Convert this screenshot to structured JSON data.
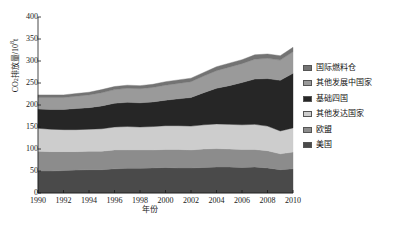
{
  "chart_data": {
    "type": "area",
    "title": "",
    "subtitle": "",
    "xlabel": "年份",
    "ylabel": "CO2排放量/10^8 t",
    "ylabel_prefix": "CO",
    "ylabel_sub": "2",
    "ylabel_mid": "排放量/10",
    "ylabel_sup": "8",
    "ylabel_suffix": "t",
    "stacked": true,
    "grid": false,
    "legend_position": "right",
    "xlim": [
      1990,
      2010
    ],
    "ylim": [
      0,
      400
    ],
    "ytick_labels": [
      "0",
      "50",
      "100",
      "150",
      "200",
      "250",
      "300",
      "350",
      "400"
    ],
    "yticks": [
      0,
      50,
      100,
      150,
      200,
      250,
      300,
      350,
      400
    ],
    "xtick_labels": [
      "1990",
      "1992",
      "1994",
      "1996",
      "1998",
      "2000",
      "2002",
      "2004",
      "2006",
      "2008",
      "2010"
    ],
    "xticks": [
      1990,
      1992,
      1994,
      1996,
      1998,
      2000,
      2002,
      2004,
      2006,
      2008,
      2010
    ],
    "x": [
      1990,
      1991,
      1992,
      1993,
      1994,
      1995,
      1996,
      1997,
      1998,
      1999,
      2000,
      2001,
      2002,
      2003,
      2004,
      2005,
      2006,
      2007,
      2008,
      2009,
      2010
    ],
    "series": [
      {
        "name": "美国",
        "color": "#4a4a4a",
        "values": [
          50,
          50,
          51,
          52,
          53,
          53,
          55,
          56,
          56,
          57,
          58,
          57,
          57,
          58,
          59,
          59,
          58,
          59,
          57,
          53,
          55
        ]
      },
      {
        "name": "欧盟",
        "color": "#8c8c8c",
        "values": [
          45,
          44,
          43,
          42,
          42,
          42,
          43,
          42,
          42,
          41,
          41,
          42,
          41,
          42,
          42,
          41,
          41,
          40,
          39,
          36,
          38
        ]
      },
      {
        "name": "其他发达国家",
        "color": "#cdcdcd",
        "values": [
          52,
          51,
          50,
          50,
          50,
          51,
          52,
          53,
          52,
          53,
          54,
          54,
          54,
          55,
          56,
          56,
          56,
          57,
          56,
          52,
          55
        ]
      },
      {
        "name": "基础四国",
        "color": "#262626",
        "values": [
          44,
          45,
          46,
          48,
          49,
          52,
          54,
          55,
          55,
          56,
          58,
          61,
          65,
          73,
          81,
          88,
          96,
          103,
          108,
          115,
          124
        ]
      },
      {
        "name": "其他发展中国家",
        "color": "#9a9a9a",
        "values": [
          26,
          27,
          27,
          28,
          29,
          30,
          31,
          32,
          32,
          33,
          34,
          35,
          36,
          38,
          40,
          42,
          43,
          45,
          46,
          46,
          49
        ]
      },
      {
        "name": "国际燃料仓",
        "color": "#737373",
        "values": [
          6,
          6,
          6,
          6,
          6,
          7,
          7,
          7,
          7,
          7,
          8,
          8,
          8,
          8,
          9,
          9,
          9,
          10,
          10,
          10,
          10
        ]
      }
    ],
    "legend_order": [
      "国际燃料仓",
      "其他发展中国家",
      "基础四国",
      "其他发达国家",
      "欧盟",
      "美国"
    ],
    "legend_colors": [
      "#737373",
      "#9a9a9a",
      "#262626",
      "#cdcdcd",
      "#8c8c8c",
      "#4a4a4a"
    ],
    "axis_color": "#1a1a1a",
    "background": "#ffffff"
  }
}
